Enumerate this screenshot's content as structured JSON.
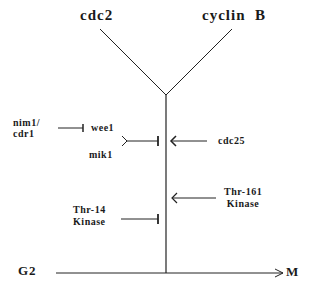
{
  "diagram": {
    "top_labels": {
      "left": "cdc2",
      "right": "cyclin  B"
    },
    "regulators": {
      "nim1_cdr1": [
        "nim1/",
        "cdr1"
      ],
      "wee1": "wee1",
      "mik1": "mik1",
      "cdc25": "cdc25",
      "thr161": [
        "Thr-161",
        "Kinase"
      ],
      "thr14": [
        "Thr-14",
        "Kinase"
      ]
    },
    "axis": {
      "start": "G2",
      "end": "M"
    },
    "edges": [
      {
        "from": "nim1/cdr1",
        "to": "wee1",
        "type": "inhibit"
      },
      {
        "from": "wee1+mik1",
        "to": "cdc2-cyclin B",
        "type": "inhibit"
      },
      {
        "from": "cdc25",
        "to": "cdc2-cyclin B",
        "type": "activate"
      },
      {
        "from": "Thr-161 Kinase",
        "to": "cdc2-cyclin B",
        "type": "activate"
      },
      {
        "from": "Thr-14 Kinase",
        "to": "cdc2-cyclin B",
        "type": "inhibit"
      },
      {
        "from": "G2",
        "to": "M",
        "type": "progression"
      }
    ],
    "colors": {
      "ink": "#1a1a1a",
      "background": "#ffffff"
    }
  }
}
